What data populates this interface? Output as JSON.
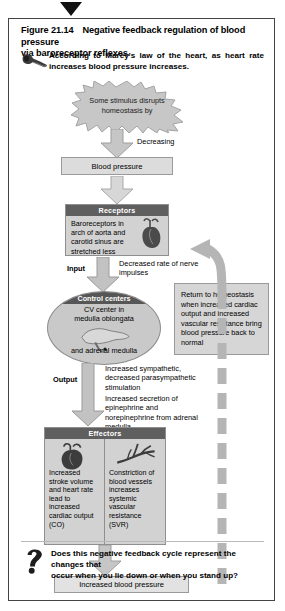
{
  "figure": {
    "number": "Figure 21.14",
    "title": "Negative feedback regulation of blood pressure via baroreceptor reflexes.",
    "title_line1": "Negative feedback regulation of blood pressure",
    "title_line2": "via baroreceptor reflexes."
  },
  "marey": {
    "icon": "horn-icon",
    "text": "According to Marey's law of the heart, as heart rate increases blood pressure increases."
  },
  "flow": {
    "stimulus": {
      "shape": "starburst",
      "line1": "Some stimulus disrupts",
      "line2": "homeostasis by"
    },
    "decreasing_label": "Decreasing",
    "blood_pressure": "Blood pressure",
    "receptors": {
      "header": "Receptors",
      "body": "Baroreceptors in arch of aorta and carotid sinus are stretched less",
      "icon": "heart-aorta-icon"
    },
    "input_label": "Input",
    "input_text": "Decreased rate of nerve impulses",
    "control_centers": {
      "header": "Control centers",
      "line1": "CV center in",
      "line2": "medulla oblongata",
      "line3": "and adrenal medulla",
      "icon": "brain-medulla-icon"
    },
    "output_label": "Output",
    "output_text_1": "Increased sympathetic, decreased parasympathetic stimulation",
    "output_text_2": "Increased secretion of epinephrine and norepinephrine from adrenal medulla",
    "effectors": {
      "header": "Effectors",
      "columns": [
        {
          "icon": "heart-icon",
          "text": "Increased stroke volume and heart rate lead to increased cardiac output (CO)"
        },
        {
          "icon": "blood-vessel-icon",
          "text": "Constriction of blood vessels increases systemic vascular resistance (SVR)"
        }
      ]
    },
    "final_outcome": "Increased blood pressure",
    "return_box": "Return to homeostasis when increased cardiac output and increased vascular resistance bring blood pressure back to normal",
    "feedback_loop": "dashed-return-arrow"
  },
  "question": {
    "icon": "question-mark-icon",
    "line1": "Does this negative feedback cycle represent the changes that",
    "line2": "occur when you lie down or when you stand up?"
  },
  "colors": {
    "box_fill": "#dcdcdc",
    "panel_fill": "#d2d2d2",
    "header_bar": "#5f5f5f",
    "arrow_fill": "#c6c6c6",
    "arrow_stroke": "#9a9a9a",
    "loop_fill": "#b5b5b5",
    "frame": "#444444"
  }
}
